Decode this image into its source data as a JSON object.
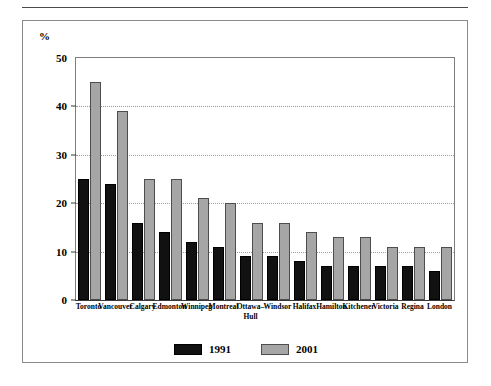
{
  "figure": {
    "has_top_rule": true,
    "border_color": "#8a8a8a",
    "background": "#ffffff"
  },
  "chart_data": {
    "type": "bar",
    "title": "",
    "subtitle": "",
    "xlabel": "",
    "ylabel": "%",
    "ylim": [
      0,
      50
    ],
    "yticks": [
      0,
      10,
      20,
      30,
      40,
      50
    ],
    "ytick_labels": [
      "0",
      "10",
      "20",
      "30",
      "40",
      "50"
    ],
    "grid": true,
    "grid_axis": "y",
    "grid_style": "dotted",
    "legend_position": "bottom-center",
    "categories": [
      "Toronto",
      "Vancouver",
      "Calgary",
      "Edmonton",
      "Winnipeg",
      "Montreal",
      "Ottawa-Hull",
      "Windsor",
      "Halifax",
      "Hamilton",
      "Kitchener",
      "Victoria",
      "Regina",
      "London"
    ],
    "category_labels": [
      {
        "line1": "Toronto",
        "line2": ""
      },
      {
        "line1": "Vancouver",
        "line2": ""
      },
      {
        "line1": "Calgary",
        "line2": ""
      },
      {
        "line1": "Edmonton",
        "line2": ""
      },
      {
        "line1": "Winnipeg",
        "line2": ""
      },
      {
        "line1": "Montreal",
        "line2": ""
      },
      {
        "line1": "Ottawa–",
        "line2": "Hull"
      },
      {
        "line1": "Windsor",
        "line2": ""
      },
      {
        "line1": "Halifax",
        "line2": ""
      },
      {
        "line1": "Hamilton",
        "line2": ""
      },
      {
        "line1": "Kitchener",
        "line2": ""
      },
      {
        "line1": "Victoria",
        "line2": ""
      },
      {
        "line1": "Regina",
        "line2": ""
      },
      {
        "line1": "London",
        "line2": ""
      }
    ],
    "series": [
      {
        "name": "1991",
        "color": "#111111",
        "values": [
          25,
          24,
          16,
          14,
          12,
          11,
          9,
          9,
          8,
          7,
          7,
          7,
          7,
          6
        ]
      },
      {
        "name": "2001",
        "color": "#a6a6a6",
        "values": [
          45,
          39,
          25,
          25,
          21,
          20,
          16,
          16,
          14,
          13,
          13,
          11,
          11,
          11
        ]
      }
    ]
  },
  "legend": {
    "items": [
      {
        "label": "1991",
        "color": "#111111"
      },
      {
        "label": "2001",
        "color": "#a6a6a6"
      }
    ]
  }
}
